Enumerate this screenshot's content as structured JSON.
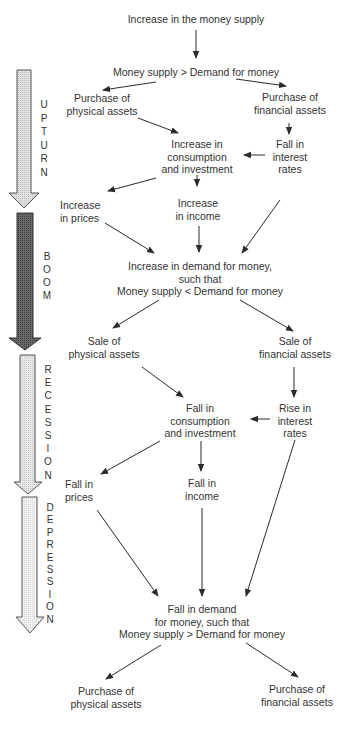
{
  "diagram": {
    "nodes": {
      "increase_money_supply": [
        "Increase in the money supply"
      ],
      "ms_gt_md_top": [
        "Money supply > Demand for money"
      ],
      "purchase_physical_1": [
        "Purchase of",
        "physical assets"
      ],
      "purchase_financial_1": [
        "Purchase of",
        "financial assets"
      ],
      "increase_consumption": [
        "Increase in",
        "consumption",
        "and investment"
      ],
      "fall_interest": [
        "Fall in",
        "interest",
        "rates"
      ],
      "increase_prices": [
        "Increase",
        "in prices"
      ],
      "increase_income": [
        "Increase",
        "in income"
      ],
      "increase_demand": [
        "Increase in demand for money,",
        "such that",
        "Money supply < Demand for money"
      ],
      "sale_physical": [
        "Sale of",
        "physical assets"
      ],
      "sale_financial": [
        "Sale of",
        "financial assets"
      ],
      "fall_consumption": [
        "Fall in",
        "consumption",
        "and investment"
      ],
      "rise_interest": [
        "Rise in",
        "interest",
        "rates"
      ],
      "fall_prices": [
        "Fall in",
        "prices"
      ],
      "fall_income": [
        "Fall in",
        "income"
      ],
      "fall_demand": [
        "Fall in demand",
        "for money, such that",
        "Money supply > Demand for money"
      ],
      "purchase_physical_2": [
        "Purchase of",
        "physical assets"
      ],
      "purchase_financial_2": [
        "Purchase of",
        "financial assets"
      ]
    },
    "phases": [
      {
        "name": "UPTURN",
        "letters": [
          "U",
          "P",
          "T",
          "U",
          "R",
          "N"
        ],
        "fill": "#d9d9d9"
      },
      {
        "name": "BOOM",
        "letters": [
          "B",
          "O",
          "O",
          "M"
        ],
        "fill": "#5a5a5a"
      },
      {
        "name": "RECESSION",
        "letters": [
          "R",
          "E",
          "C",
          "E",
          "S",
          "S",
          "I",
          "O",
          "N"
        ],
        "fill": "#dedede"
      },
      {
        "name": "DEPRESSION",
        "letters": [
          "D",
          "E",
          "P",
          "R",
          "E",
          "S",
          "S",
          "I",
          "O",
          "N"
        ],
        "fill": "#ececec"
      }
    ],
    "colors": {
      "line": "#2a2a2a",
      "text": "#333333",
      "arrow_outline": "#555555"
    }
  }
}
